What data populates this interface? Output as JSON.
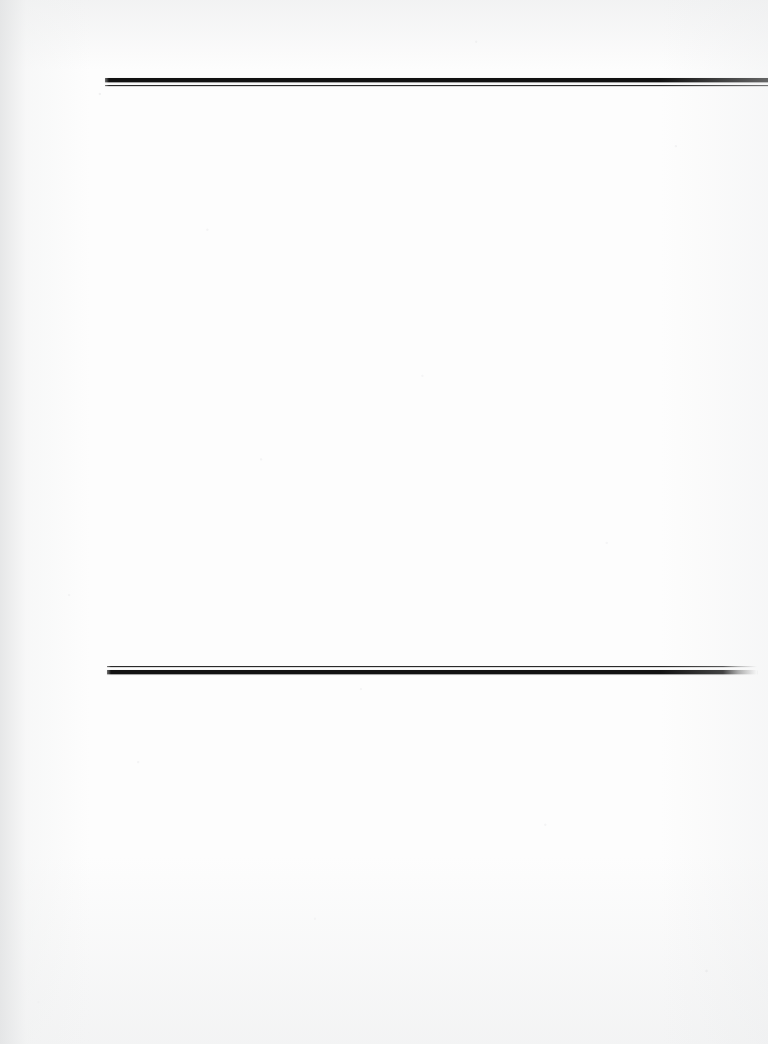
{
  "page": {
    "kind": "scanned-book-page",
    "width": 768,
    "height": 1044,
    "paper_color": "#fdfdfd",
    "ink_color": "#121212",
    "edge_shadow_color": "#e2e3e4"
  },
  "rules": {
    "top": {
      "name": "top-double-rule",
      "order": "thick-then-thin",
      "left": 105,
      "top": 78,
      "width": 663,
      "thick_height": 4,
      "thin_height": 1,
      "gap": 3,
      "bleeds_right_edge": true
    },
    "bottom": {
      "name": "bottom-double-rule",
      "order": "thin-then-thick",
      "left": 107,
      "top": 666,
      "width": 650,
      "thick_height": 4,
      "thin_height": 1,
      "gap": 3,
      "bleeds_right_edge": false
    }
  },
  "content": {
    "header_text": "",
    "body_text": "",
    "footer_text": "",
    "page_number": "",
    "running_head": ""
  }
}
